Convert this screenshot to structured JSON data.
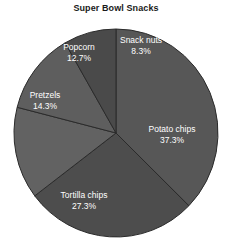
{
  "chart_data": {
    "type": "pie",
    "title": "Super Bowl Snacks",
    "xlabel": "",
    "ylabel": "",
    "categories": [
      "Potato chips",
      "Tortilla chips",
      "Pretzels",
      "Popcorn",
      "Snack nuts"
    ],
    "values": [
      37.3,
      27.3,
      14.3,
      12.7,
      8.3
    ],
    "value_suffix": "%",
    "legend": "none",
    "grid": false,
    "start_angle_deg": 0,
    "direction": "clockwise",
    "slices": [
      {
        "label": "Potato chips",
        "percent": "37.3%",
        "value": 37.3,
        "color": "#575757",
        "label_x": 172,
        "label_y": 130,
        "pct_x": 172,
        "pct_y": 141
      },
      {
        "label": "Tortilla chips",
        "percent": "27.3%",
        "value": 27.3,
        "color": "#4d4d4d",
        "label_x": 84,
        "label_y": 196,
        "pct_x": 84,
        "pct_y": 207
      },
      {
        "label": "Pretzels",
        "percent": "14.3%",
        "value": 14.3,
        "color": "#626262",
        "label_x": 45,
        "label_y": 96,
        "pct_x": 45,
        "pct_y": 107
      },
      {
        "label": "Popcorn",
        "percent": "12.7%",
        "value": 12.7,
        "color": "#5e5e5e",
        "label_x": 79,
        "label_y": 48,
        "pct_x": 79,
        "pct_y": 59
      },
      {
        "label": "Snack nuts",
        "percent": "8.3%",
        "value": 8.3,
        "color": "#4a4a4a",
        "label_x": 141,
        "label_y": 41,
        "pct_x": 141,
        "pct_y": 52
      }
    ],
    "geometry": {
      "center_x": 116,
      "center_y": 133,
      "radius_x": 102,
      "radius_y": 104,
      "edge_color": "#2b2b2b",
      "background": "#ffffff"
    }
  }
}
